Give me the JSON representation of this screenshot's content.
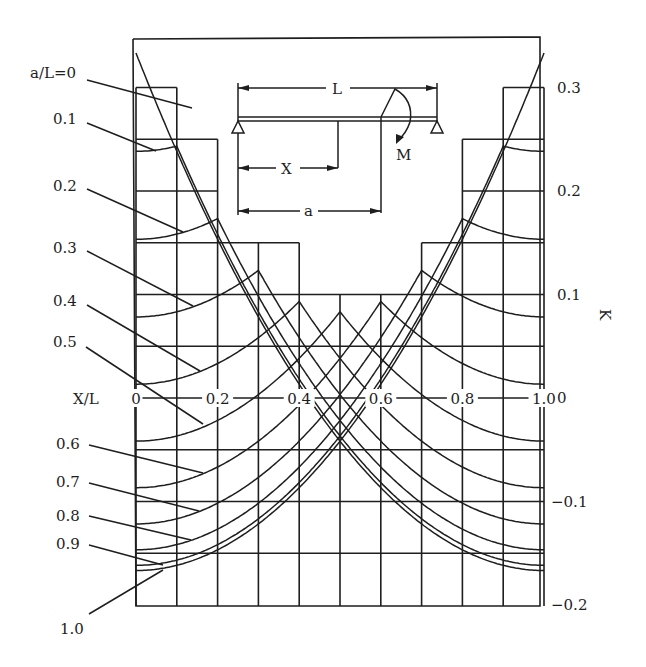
{
  "chart_data": {
    "type": "line",
    "title": "",
    "xlabel": "X/L",
    "ylabel": "K",
    "xlim": [
      0,
      1.0
    ],
    "ylim": [
      -0.2,
      0.3
    ],
    "x_ticks": [
      "0",
      "0.2",
      "0.4",
      "0.6",
      "0.8",
      "1.0"
    ],
    "y_ticks": [
      "0.3",
      "0.2",
      "0.1",
      "0",
      "−0.1",
      "−0.2"
    ],
    "grid": true,
    "x": [
      0,
      0.1,
      0.2,
      0.3,
      0.4,
      0.5,
      0.6,
      0.7,
      0.8,
      0.9,
      1.0
    ],
    "series": [
      {
        "name": "a/L=0",
        "a": 0.0,
        "values": [
          0.333,
          0.238,
          0.153,
          0.078,
          0.013,
          -0.042,
          -0.087,
          -0.122,
          -0.147,
          -0.162,
          -0.167
        ]
      },
      {
        "name": "0.1",
        "a": 0.1,
        "values": [
          0.238,
          0.243,
          0.158,
          0.083,
          0.018,
          -0.037,
          -0.082,
          -0.117,
          -0.142,
          -0.157,
          -0.162
        ]
      },
      {
        "name": "0.2",
        "a": 0.2,
        "values": [
          0.153,
          0.158,
          0.173,
          0.098,
          0.033,
          -0.022,
          -0.067,
          -0.102,
          -0.127,
          -0.142,
          -0.147
        ]
      },
      {
        "name": "0.3",
        "a": 0.3,
        "values": [
          0.078,
          0.083,
          0.098,
          0.123,
          0.058,
          0.003,
          -0.042,
          -0.077,
          -0.102,
          -0.117,
          -0.122
        ]
      },
      {
        "name": "0.4",
        "a": 0.4,
        "values": [
          0.013,
          0.018,
          0.033,
          0.058,
          0.093,
          0.038,
          -0.007,
          -0.042,
          -0.067,
          -0.082,
          -0.087
        ]
      },
      {
        "name": "0.5",
        "a": 0.5,
        "values": [
          -0.042,
          -0.037,
          -0.022,
          0.003,
          0.038,
          0.083,
          0.038,
          0.003,
          -0.022,
          -0.037,
          -0.042
        ]
      },
      {
        "name": "0.6",
        "a": 0.6,
        "values": [
          -0.087,
          -0.082,
          -0.067,
          -0.042,
          -0.007,
          0.038,
          0.093,
          0.058,
          0.033,
          0.018,
          0.013
        ]
      },
      {
        "name": "0.7",
        "a": 0.7,
        "values": [
          -0.122,
          -0.117,
          -0.102,
          -0.077,
          -0.042,
          0.003,
          0.058,
          0.123,
          0.098,
          0.083,
          0.078
        ]
      },
      {
        "name": "0.8",
        "a": 0.8,
        "values": [
          -0.147,
          -0.142,
          -0.127,
          -0.102,
          -0.067,
          -0.022,
          0.033,
          0.098,
          0.173,
          0.158,
          0.153
        ]
      },
      {
        "name": "0.9",
        "a": 0.9,
        "values": [
          -0.162,
          -0.157,
          -0.142,
          -0.117,
          -0.082,
          -0.037,
          0.018,
          0.083,
          0.158,
          0.243,
          0.238
        ]
      },
      {
        "name": "1.0",
        "a": 1.0,
        "values": [
          -0.167,
          -0.162,
          -0.147,
          -0.122,
          -0.087,
          -0.042,
          0.013,
          0.078,
          0.153,
          0.238,
          0.333
        ]
      }
    ],
    "curve_labels": [
      {
        "text": "a/L=0",
        "tx": 30,
        "ty": 78,
        "x1": 87,
        "y1": 80,
        "x2": 192,
        "y2": 108
      },
      {
        "text": "0.1",
        "tx": 53,
        "ty": 124,
        "x1": 87,
        "y1": 123,
        "x2": 156,
        "y2": 151
      },
      {
        "text": "0.2",
        "tx": 53,
        "ty": 191,
        "x1": 87,
        "y1": 189,
        "x2": 183,
        "y2": 232
      },
      {
        "text": "0.3",
        "tx": 53,
        "ty": 253,
        "x1": 87,
        "y1": 251,
        "x2": 193,
        "y2": 306
      },
      {
        "text": "0.4",
        "tx": 53,
        "ty": 306,
        "x1": 87,
        "y1": 305,
        "x2": 200,
        "y2": 371
      },
      {
        "text": "0.5",
        "tx": 53,
        "ty": 347,
        "x1": 86,
        "y1": 347,
        "x2": 203,
        "y2": 424
      },
      {
        "text": "0.6",
        "tx": 56,
        "ty": 449,
        "x1": 89,
        "y1": 445,
        "x2": 203,
        "y2": 473
      },
      {
        "text": "0.7",
        "tx": 56,
        "ty": 487,
        "x1": 89,
        "y1": 483,
        "x2": 199,
        "y2": 511
      },
      {
        "text": "0.8",
        "tx": 56,
        "ty": 521,
        "x1": 89,
        "y1": 516,
        "x2": 191,
        "y2": 540
      },
      {
        "text": "0.9",
        "tx": 56,
        "ty": 549,
        "x1": 89,
        "y1": 545,
        "x2": 163,
        "y2": 565
      },
      {
        "text": "1.0",
        "tx": 60,
        "ty": 634,
        "x1": 89,
        "y1": 614,
        "x2": 163,
        "y2": 570
      }
    ],
    "annotations": {
      "beam_L": "L",
      "beam_X": "X",
      "beam_a": "a",
      "beam_M": "M"
    }
  }
}
